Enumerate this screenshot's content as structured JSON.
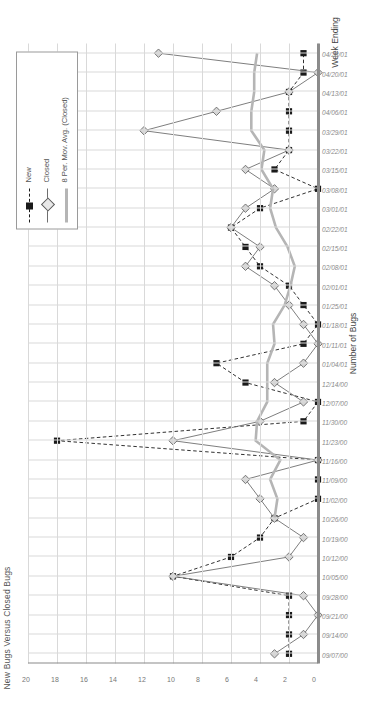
{
  "chart_data": {
    "type": "line",
    "title": "New Bugs Versus Closed Bugs",
    "xlabel": "Week Ending",
    "ylabel": "Number of Bugs",
    "ylim": [
      0,
      20
    ],
    "ytick_step": 2,
    "yticks": [
      "0",
      "2",
      "4",
      "6",
      "8",
      "10",
      "12",
      "14",
      "16",
      "18",
      "20"
    ],
    "grid": true,
    "legend_position": "top-right",
    "orientation": "rotated-90-ccw",
    "categories": [
      "09/07/00",
      "09/14/00",
      "09/21/00",
      "09/28/00",
      "10/05/00",
      "10/12/00",
      "10/19/00",
      "10/26/00",
      "11/02/00",
      "11/09/00",
      "11/16/00",
      "11/23/00",
      "11/30/00",
      "12/07/00",
      "12/14/00",
      "01/04/01",
      "01/11/01",
      "01/18/01",
      "01/25/01",
      "02/01/01",
      "02/08/01",
      "02/15/01",
      "02/22/01",
      "03/01/01",
      "03/08/01",
      "03/15/01",
      "03/22/01",
      "03/29/01",
      "04/06/01",
      "04/13/01",
      "04/20/01",
      "04/28/01"
    ],
    "series": [
      {
        "name": "New",
        "marker": "filled-square",
        "line": "dashed",
        "color": "#1a1a1a",
        "values": [
          2,
          2,
          2,
          2,
          10,
          6,
          4,
          3,
          0,
          0,
          0,
          18,
          1,
          0,
          5,
          7,
          1,
          0,
          1,
          2,
          4,
          5,
          6,
          4,
          0,
          3,
          2,
          2,
          2,
          2,
          1,
          1
        ]
      },
      {
        "name": "Closed",
        "marker": "diamond",
        "line": "solid",
        "color": "#6f6f6f",
        "values": [
          3,
          1,
          0,
          1,
          10,
          2,
          1,
          3,
          4,
          5,
          0,
          10,
          4,
          1,
          3,
          1,
          0,
          1,
          2,
          3,
          5,
          4,
          6,
          5,
          3,
          5,
          2,
          12,
          7,
          2,
          0,
          11
        ]
      },
      {
        "name": "8 Per. Mov. Avg. (Closed)",
        "marker": "none",
        "line": "thick-solid",
        "color": "#b5b5b5",
        "values": [
          null,
          null,
          null,
          null,
          null,
          null,
          null,
          3.0,
          2.8,
          3.3,
          2.6,
          4.3,
          4.2,
          3.5,
          3.5,
          3.5,
          3.0,
          3.1,
          2.3,
          1.9,
          1.6,
          2.1,
          2.9,
          3.3,
          3.1,
          3.9,
          3.7,
          4.6,
          4.6,
          4.4,
          4.4,
          4.2
        ]
      }
    ],
    "legend": [
      {
        "label": "New",
        "marker": "filled-square",
        "line": "dashed",
        "color": "#1a1a1a"
      },
      {
        "label": "Closed",
        "marker": "diamond",
        "line": "solid",
        "color": "#6f6f6f"
      },
      {
        "label": "8 Per. Mov. Avg. (Closed)",
        "marker": "none",
        "line": "thick-solid",
        "color": "#b5b5b5"
      }
    ]
  }
}
